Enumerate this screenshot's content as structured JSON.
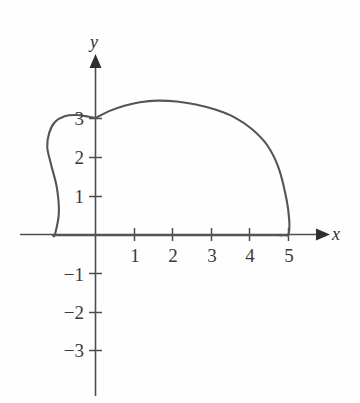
{
  "figure": {
    "background_color": "#fefefe",
    "curve_color": "#555555",
    "axis_color": "#4d4d4d",
    "label_color": "#3a3a3a",
    "x_axis_label": "x",
    "y_axis_label": "y"
  },
  "axes": {
    "x_ticks": [
      {
        "value": 1,
        "label": "1"
      },
      {
        "value": 2,
        "label": "2"
      },
      {
        "value": 3,
        "label": "3"
      },
      {
        "value": 4,
        "label": "4"
      },
      {
        "value": 5,
        "label": "5"
      }
    ],
    "y_ticks": [
      {
        "value": 3,
        "label": "3"
      },
      {
        "value": 2,
        "label": "2"
      },
      {
        "value": 1,
        "label": "1"
      },
      {
        "value": -1,
        "label": "−1"
      },
      {
        "value": -2,
        "label": "−2"
      },
      {
        "value": -3,
        "label": "−3"
      }
    ]
  },
  "chart_data": {
    "type": "line",
    "title": "",
    "xlabel": "x",
    "ylabel": "y",
    "xlim": [
      -2,
      6
    ],
    "ylim": [
      -4.5,
      4
    ],
    "grid": false,
    "legend": null,
    "annotations": [],
    "series": [
      {
        "name": "curve",
        "closed": false,
        "comment": "Closed-ish loop starting at (0,3), arcing right over a maximum near (1.6,3.45), descending steeply to (5,0), then returning leftward below and looping back through (-1.05,0) and down to (0,-3).",
        "x": [
          0.0,
          0.35,
          0.75,
          1.15,
          1.6,
          2.1,
          2.6,
          3.1,
          3.6,
          4.05,
          4.45,
          4.75,
          4.95,
          5.02,
          5.0,
          4.9,
          4.6,
          4.2,
          3.7,
          3.2,
          2.7,
          2.2,
          1.7,
          1.2,
          0.75,
          0.35,
          0.0,
          -0.4,
          -0.75,
          -1.0,
          -1.1,
          -1.05,
          -0.95,
          -1.0,
          -1.15,
          -1.25,
          -1.2,
          -1.05,
          -0.8,
          -0.5,
          -0.2,
          0.0
        ],
        "y": [
          3.0,
          3.18,
          3.32,
          3.41,
          3.45,
          3.43,
          3.35,
          3.22,
          3.02,
          2.72,
          2.3,
          1.7,
          0.9,
          0.35,
          0.0,
          -0.02,
          -0.02,
          -0.02,
          -0.02,
          -0.02,
          -0.02,
          -0.02,
          -0.02,
          -0.02,
          -0.02,
          -0.02,
          -0.02,
          -0.02,
          -0.02,
          -0.02,
          -0.02,
          0.0,
          0.55,
          1.2,
          1.8,
          2.25,
          2.62,
          2.9,
          3.05,
          3.08,
          3.04,
          3.0
        ],
        "key_points": [
          {
            "label": "y-intercept (top)",
            "x": 0,
            "y": 3
          },
          {
            "label": "maximum",
            "x": 1.6,
            "y": 3.45
          },
          {
            "label": "x-intercept (right)",
            "x": 5,
            "y": 0
          },
          {
            "label": "x-intercept (left)",
            "x": -1.05,
            "y": 0
          },
          {
            "label": "leftmost extent",
            "x": -1.25,
            "y": 1.8
          },
          {
            "label": "y-intercept (bottom)",
            "x": 0,
            "y": -3
          }
        ]
      }
    ]
  }
}
